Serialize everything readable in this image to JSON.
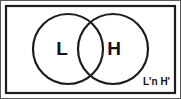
{
  "diagram": {
    "type": "venn-2-set",
    "universe": {
      "name": "universal-set-rectangle",
      "label": ""
    },
    "sets": [
      {
        "id": "L",
        "label": "L",
        "cx": 68,
        "cy": 49,
        "r": 35
      },
      {
        "id": "H",
        "label": "H",
        "cx": 113,
        "cy": 49,
        "r": 35
      }
    ],
    "region_label": {
      "text": "L'n H'",
      "meaning": "L' ∩ H'",
      "x": 170,
      "y": 82
    },
    "colors": {
      "stroke": "#1d1d1d",
      "fill": "#ffffff",
      "text": "#141414",
      "frame": "#5a5a5a"
    }
  }
}
